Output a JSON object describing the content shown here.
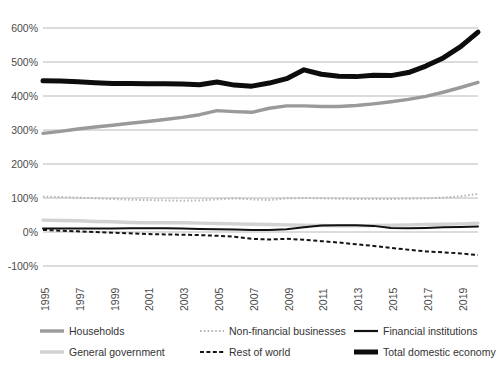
{
  "chart_data": {
    "type": "line",
    "title": "",
    "xlabel": "",
    "ylabel": "",
    "ylim": [
      -100,
      600
    ],
    "yticks": [
      600,
      500,
      400,
      300,
      200,
      100,
      0,
      -100
    ],
    "ytick_labels": [
      "600%",
      "500%",
      "400%",
      "300%",
      "200%",
      "100%",
      "0%",
      "-100%"
    ],
    "grid": true,
    "legend_position": "bottom",
    "x": [
      1995,
      1996,
      1997,
      1998,
      1999,
      2000,
      2001,
      2002,
      2003,
      2004,
      2005,
      2006,
      2007,
      2008,
      2009,
      2010,
      2011,
      2012,
      2013,
      2014,
      2015,
      2016,
      2017,
      2018,
      2019,
      2020
    ],
    "xtick_labels": [
      "1995",
      "1997",
      "1999",
      "2001",
      "2003",
      "2005",
      "2007",
      "2009",
      "2011",
      "2013",
      "2015",
      "2017",
      "2019"
    ],
    "series": [
      {
        "name": "Households",
        "color": "#9a9a9a",
        "style": "solid",
        "width": 3.4,
        "values": [
          290,
          296,
          303,
          309,
          314,
          320,
          325,
          331,
          337,
          345,
          357,
          354,
          352,
          364,
          371,
          371,
          369,
          369,
          372,
          377,
          383,
          390,
          399,
          411,
          425,
          440
        ]
      },
      {
        "name": "General government",
        "color": "#d2d2d2",
        "style": "solid",
        "width": 3.4,
        "values": [
          35,
          34,
          33,
          31,
          30,
          28,
          27,
          27,
          27,
          26,
          25,
          24,
          23,
          22,
          21,
          20,
          19,
          18,
          18,
          19,
          20,
          21,
          22,
          23,
          24,
          26
        ]
      },
      {
        "name": "Non-financial businesses",
        "color": "#b4b4b4",
        "style": "dotted",
        "width": 2.0,
        "values": [
          104,
          103,
          101,
          99,
          97,
          95,
          94,
          93,
          92,
          93,
          96,
          99,
          96,
          94,
          99,
          100,
          99,
          98,
          97,
          97,
          97,
          98,
          99,
          101,
          105,
          112
        ]
      },
      {
        "name": "Rest of world",
        "color": "#141414",
        "style": "dashed",
        "width": 2.0,
        "values": [
          6,
          4,
          2,
          0,
          -2,
          -4,
          -6,
          -7,
          -8,
          -9,
          -11,
          -14,
          -20,
          -22,
          -20,
          -23,
          -27,
          -31,
          -36,
          -41,
          -47,
          -52,
          -57,
          -60,
          -63,
          -68
        ]
      },
      {
        "name": "Financial institutions",
        "color": "#111111",
        "style": "solid",
        "width": 2.0,
        "values": [
          10,
          10,
          10,
          10,
          10,
          11,
          11,
          11,
          10,
          9,
          8,
          7,
          6,
          6,
          8,
          14,
          19,
          20,
          20,
          18,
          12,
          11,
          12,
          14,
          15,
          16
        ]
      },
      {
        "name": "Total domestic economy",
        "color": "#0d0d0d",
        "style": "solid",
        "width": 5.0,
        "values": [
          445,
          444,
          442,
          439,
          437,
          437,
          436,
          436,
          435,
          433,
          441,
          432,
          429,
          438,
          451,
          477,
          464,
          458,
          457,
          461,
          460,
          469,
          488,
          512,
          545,
          588
        ]
      }
    ]
  },
  "legend": {
    "items": [
      {
        "label": "Households"
      },
      {
        "label": "Non-financial businesses"
      },
      {
        "label": "Financial institutions"
      },
      {
        "label": "General government"
      },
      {
        "label": "Rest of world"
      },
      {
        "label": "Total domestic economy"
      }
    ]
  },
  "colors": {
    "grid": "#b0b0b0",
    "axis_text": "#4a4a4a",
    "background": "#ffffff"
  }
}
